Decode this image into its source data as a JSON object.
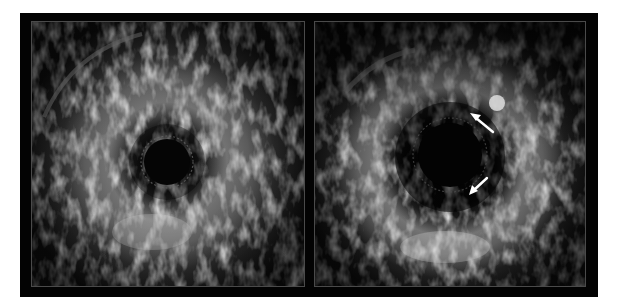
{
  "figure": {
    "background": "#ffffff",
    "frame_color": "#030303",
    "panel_border_color": "#4a4a4a",
    "panels": [
      {
        "id": "left",
        "label": "IVUS cross-section (left)",
        "lumen": {
          "cx": 135,
          "cy": 140,
          "r": 23
        },
        "arrows": []
      },
      {
        "id": "right",
        "label": "IVUS cross-section (right)",
        "lumen": {
          "cx": 135,
          "cy": 133,
          "r": 32
        },
        "bright_spot": {
          "cx": 182,
          "cy": 81,
          "r": 8
        },
        "arrows": [
          {
            "name": "upper-arrow",
            "from": [
              178,
              110
            ],
            "to": [
              157,
              93
            ],
            "color": "#ffffff"
          },
          {
            "name": "lower-arrow",
            "from": [
              171,
              156
            ],
            "to": [
              155,
              171
            ],
            "color": "#ffffff"
          }
        ]
      }
    ]
  }
}
